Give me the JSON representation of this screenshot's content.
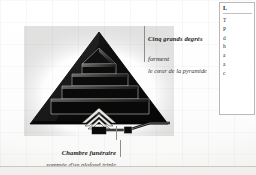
{
  "page": {
    "background_color": "#fdfdfc",
    "rule_color": "#c9c9c6"
  },
  "figure": {
    "name": "pyramid-cross-section",
    "fill_color": "#141414",
    "outline_color": "#000000",
    "chamber_color": "#1a1a1a",
    "levels": 5,
    "captions": {
      "top": {
        "lead": "Cinq grands degrés",
        "tail": " forment",
        "sub": "le cœur de la pyramide"
      },
      "bottom": {
        "lead": "Chambre funéraire",
        "tail": "",
        "sub": "sommée d'un plafond triple"
      }
    }
  },
  "text_column": {
    "heading": "L",
    "lines": [
      "T",
      "P",
      "d",
      "h",
      "a",
      "a",
      "c"
    ]
  }
}
